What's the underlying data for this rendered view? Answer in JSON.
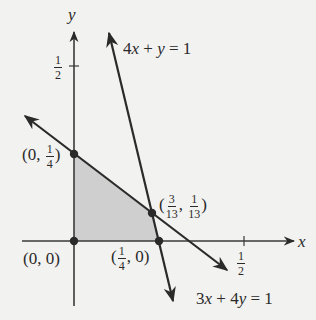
{
  "diagram": {
    "type": "linear-inequality-feasible-region",
    "axes": {
      "x_label": "x",
      "y_label": "y",
      "x_tick": {
        "value": "1/2",
        "num": "1",
        "den": "2"
      },
      "y_tick": {
        "value": "1/2",
        "num": "1",
        "den": "2"
      }
    },
    "lines": [
      {
        "equation": "4x + y = 1",
        "label_parts": {
          "a": "4",
          "v1": "x",
          "op": " + ",
          "v2": "y",
          "rhs": " = 1"
        }
      },
      {
        "equation": "3x + 4y = 1",
        "label_parts": {
          "a": "3",
          "v1": "x",
          "op": " + ",
          "b": "4",
          "v2": "y",
          "rhs": " = 1"
        }
      }
    ],
    "vertices": [
      {
        "label": "(0, 0)",
        "x": 0,
        "y": 0
      },
      {
        "label": "(0, 1/4)",
        "x": 0,
        "y": 0.25,
        "parts": {
          "open": "(0, ",
          "num": "1",
          "den": "4",
          "close": ")"
        }
      },
      {
        "label": "(3/13, 1/13)",
        "x": 0.2308,
        "y": 0.0769,
        "parts": {
          "open": "(",
          "xnum": "3",
          "xden": "13",
          "sep": ", ",
          "ynum": "1",
          "yden": "13",
          "close": ")"
        }
      },
      {
        "label": "(1/4, 0)",
        "x": 0.25,
        "y": 0,
        "parts": {
          "open": "(",
          "num": "1",
          "den": "4",
          "close": ", 0)"
        }
      }
    ],
    "shaded_region": "feasible region bounded by axes, 3x+4y=1 and 4x+y=1",
    "colors": {
      "background": "#f2f2f0",
      "shade": "#cfcfcf",
      "ink": "#2a2a2a"
    }
  }
}
